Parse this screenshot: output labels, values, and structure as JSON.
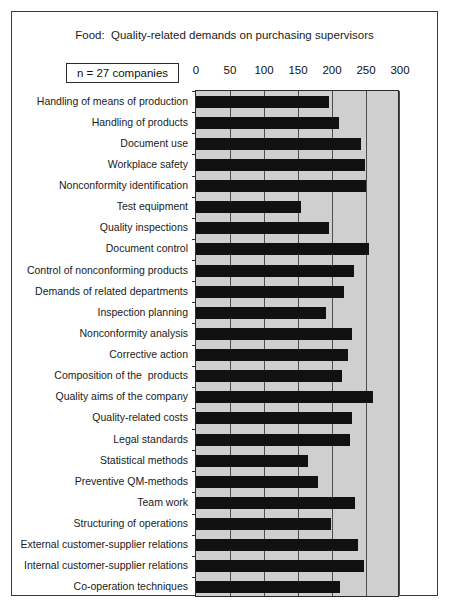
{
  "figure": {
    "title": "Food:  Quality-related demands on purchasing supervisors",
    "sample_size_label": "n = 27 companies",
    "border_color": "#3a3a3a",
    "plot_background": "#cfcfcf",
    "bar_color": "#111111",
    "gridline_color": "#4d4d4d"
  },
  "chart_data": {
    "type": "bar",
    "orientation": "horizontal",
    "title": "Food:  Quality-related demands on purchasing supervisors",
    "subtitle": "n = 27 companies",
    "xlabel": "",
    "ylabel": "",
    "xlim": [
      0,
      300
    ],
    "xticks": [
      0,
      50,
      100,
      150,
      200,
      250,
      300
    ],
    "xtick_labels": [
      "0",
      "50",
      "100",
      "150",
      "200",
      "250",
      "300"
    ],
    "grid": true,
    "legend": false,
    "categories": [
      "Handling of means of production",
      "Handling of products",
      "Document use",
      "Workplace safety",
      "Nonconformity identification",
      "Test equipment",
      "Quality inspections",
      "Document control",
      "Control of nonconforming products",
      "Demands of related departments",
      "Inspection planning",
      "Nonconformity analysis",
      "Corrective action",
      "Composition of the  products",
      "Quality aims of the company",
      "Quality-related costs",
      "Legal standards",
      "Statistical methods",
      "Preventive QM-methods",
      "Team work",
      "Structuring of operations",
      "External customer-supplier relations",
      "Internal customer-supplier relations",
      "Co-operation techniques"
    ],
    "values": [
      195,
      211,
      243,
      249,
      250,
      154,
      195,
      254,
      232,
      218,
      191,
      230,
      223,
      215,
      260,
      229,
      227,
      165,
      180,
      234,
      199,
      238,
      247,
      212
    ]
  }
}
